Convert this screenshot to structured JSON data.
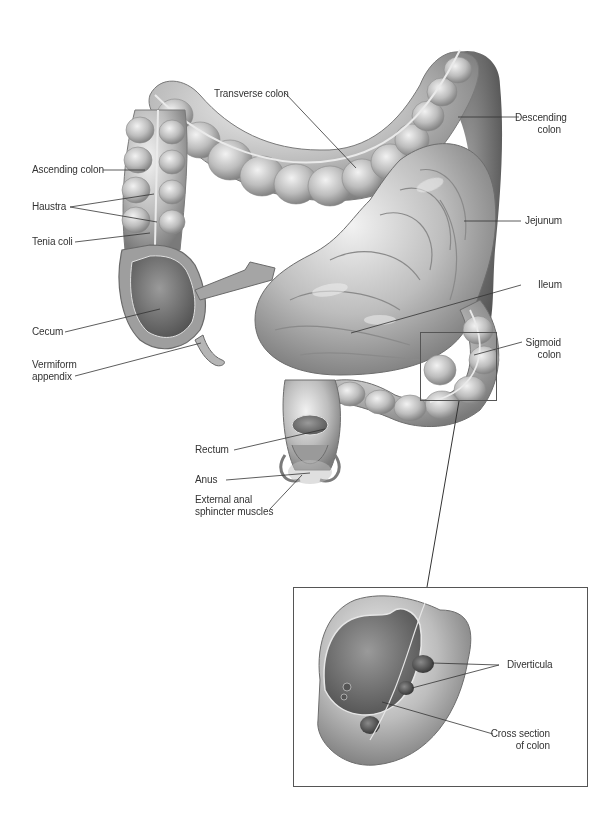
{
  "diagram": {
    "colors": {
      "background": "#ffffff",
      "organ_light": "#d9d9d9",
      "organ_mid": "#a8a8a8",
      "organ_dark": "#6e6e6e",
      "leader_line": "#333333",
      "label_text": "#333333"
    },
    "labels": {
      "transverse_colon": "Transverse colon",
      "descending_colon": "Descending\ncolon",
      "ascending_colon": "Ascending colon",
      "haustra": "Haustra",
      "tenia_coli": "Tenia coli",
      "jejunum": "Jejunum",
      "ileum": "Ileum",
      "cecum": "Cecum",
      "sigmoid_colon": "Sigmoid\ncolon",
      "vermiform_appendix": "Vermiform\nappendix",
      "rectum": "Rectum",
      "anus": "Anus",
      "external_anal_sphincter": "External anal\nsphincter muscles"
    },
    "inset": {
      "labels": {
        "diverticula": "Diverticula",
        "cross_section": "Cross section\nof colon"
      }
    }
  }
}
